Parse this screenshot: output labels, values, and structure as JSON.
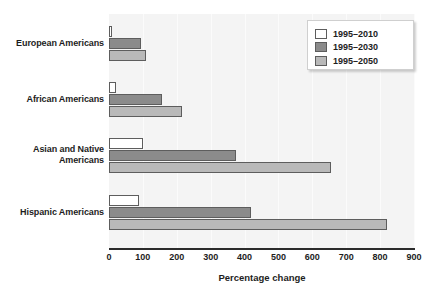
{
  "chart_data": {
    "type": "bar",
    "orientation": "horizontal",
    "title": "",
    "xlabel": "Percentage change",
    "ylabel": "",
    "xlim": [
      0,
      900
    ],
    "xticks": [
      0,
      100,
      200,
      300,
      400,
      500,
      600,
      700,
      800,
      900
    ],
    "xtick_labels": [
      "0",
      "100",
      "200",
      "300",
      "400",
      "500",
      "600",
      "700",
      "800",
      "900"
    ],
    "grid": true,
    "grid_axis": "x",
    "legend_position": "top-right",
    "categories": [
      "European Americans",
      "African Americans",
      "Asian and Native Americans",
      "Hispanic Americans"
    ],
    "category_lines": [
      [
        "European Americans"
      ],
      [
        "African Americans"
      ],
      [
        "Asian and Native",
        "Americans"
      ],
      [
        "Hispanic Americans"
      ]
    ],
    "series": [
      {
        "name": "1995–2010",
        "color": "#ffffff",
        "values": [
          8,
          22,
          100,
          88
        ]
      },
      {
        "name": "1995–2030",
        "color": "#8b8b8b",
        "values": [
          93,
          155,
          375,
          420
        ]
      },
      {
        "name": "1995–2050",
        "color": "#b9b9b9",
        "values": [
          110,
          215,
          655,
          820
        ]
      }
    ]
  },
  "colors": {
    "plot_background": "#f4f4f4",
    "gridline": "#fbfbfb",
    "axis": "#2b2b2b",
    "bar_border": "#5d5d5d",
    "text": "#1d1d1d",
    "legend_background": "#ffffff",
    "legend_border": "#cfcfcf"
  }
}
